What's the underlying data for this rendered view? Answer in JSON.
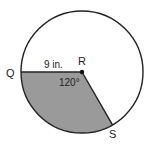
{
  "diagram": {
    "type": "circle-sector",
    "center_label": "R",
    "point_q_label": "Q",
    "point_s_label": "S",
    "radius_label": "9 in.",
    "angle_label": "120°",
    "colors": {
      "stroke": "#222222",
      "sector_fill": "#9a9a9a",
      "background": "#ffffff"
    }
  }
}
